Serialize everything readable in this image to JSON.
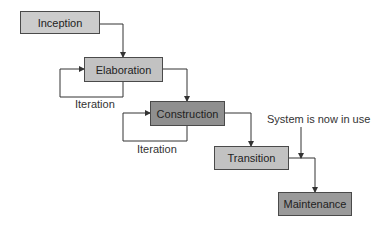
{
  "diagram": {
    "phases": [
      {
        "id": "inception",
        "label": "Inception"
      },
      {
        "id": "elaboration",
        "label": "Elaboration"
      },
      {
        "id": "construction",
        "label": "Construction"
      },
      {
        "id": "transition",
        "label": "Transition"
      },
      {
        "id": "maintenance",
        "label": "Maintenance"
      }
    ],
    "loop_labels": [
      "Iteration",
      "Iteration"
    ],
    "annotation": "System is now in use",
    "colors": {
      "light_box": "#cccccc",
      "dark_box": "#8f8f8f",
      "line": "#333333"
    }
  }
}
